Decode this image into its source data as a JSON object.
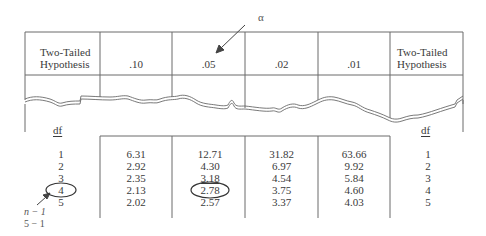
{
  "figure": {
    "alpha_label": "α",
    "top_table": {
      "left_header": "Two-Tailed Hypothesis",
      "left_header_lines": [
        "Two-Tailed",
        "Hypothesis"
      ],
      "right_header_lines": [
        "Two-Tailed",
        "Hypothesis"
      ],
      "alpha_levels": [
        ".10",
        ".05",
        ".02",
        ".01"
      ]
    },
    "df_label_left": "df",
    "df_label_right": "df",
    "df_values": [
      "1",
      "2",
      "3",
      "4",
      "5"
    ],
    "columns": [
      {
        "alpha": ".10",
        "values": [
          "6.31",
          "2.92",
          "2.35",
          "2.13",
          "2.02"
        ]
      },
      {
        "alpha": ".05",
        "values": [
          "12.71",
          "4.30",
          "3.18",
          "2.78",
          "2.57"
        ]
      },
      {
        "alpha": ".02",
        "values": [
          "31.82",
          "6.97",
          "4.54",
          "3.75",
          "3.37"
        ]
      },
      {
        "alpha": ".01",
        "values": [
          "63.66",
          "9.92",
          "5.84",
          "4.60",
          "4.03"
        ]
      }
    ],
    "highlight": {
      "df": "4",
      "critical_value": "2.78"
    },
    "annotation_lines": [
      "n − 1",
      "5 − 1"
    ],
    "colors": {
      "line": "#6a6a6a",
      "text": "#3a3a3a",
      "background": "#ffffff"
    }
  }
}
